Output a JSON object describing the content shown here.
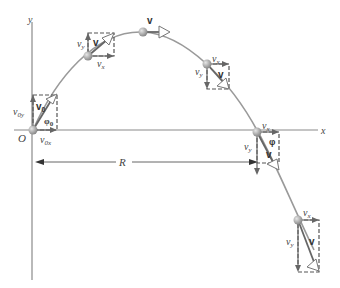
{
  "figure": {
    "axes": {
      "x_label": "x",
      "y_label": "y",
      "origin_label": "O"
    },
    "range_label": "R",
    "colors": {
      "curve": "#9a9a9a",
      "ball": "#9a9a9a",
      "axis": "#8a8a8a",
      "vector": "#666666"
    },
    "positions": [
      {
        "name": "launch",
        "vector_label": "v",
        "vector_subscript": "0",
        "vx_label": "v",
        "vx_sub": "0x",
        "vy_label": "v",
        "vy_sub": "0y",
        "angle_label": "φ",
        "angle_sub": "0"
      },
      {
        "name": "rising",
        "vector_label": "v",
        "vx_label": "v",
        "vx_sub": "x",
        "vy_label": "v",
        "vy_sub": "y"
      },
      {
        "name": "peak",
        "vector_label": "v"
      },
      {
        "name": "falling",
        "vector_label": "v",
        "vx_label": "v",
        "vx_sub": "x",
        "vy_label": "v",
        "vy_sub": "y"
      },
      {
        "name": "landing",
        "vector_label": "v",
        "vx_label": "v",
        "vx_sub": "x",
        "vy_label": "v",
        "vy_sub": "y",
        "angle_label": "φ"
      },
      {
        "name": "below-origin",
        "vector_label": "v",
        "vx_label": "v",
        "vx_sub": "x",
        "vy_label": "v",
        "vy_sub": "y"
      }
    ]
  }
}
